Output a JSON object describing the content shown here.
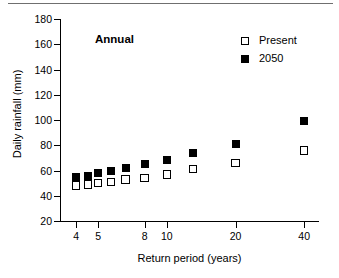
{
  "chart_data": {
    "type": "scatter",
    "title": "",
    "annotation": "Annual",
    "xlabel": "Return period (years)",
    "ylabel": "Daily rainfall (mm)",
    "xscale": "log",
    "xlim": [
      3.4,
      46
    ],
    "ylim": [
      20,
      180
    ],
    "yticks": [
      20,
      40,
      60,
      80,
      100,
      120,
      140,
      160,
      180
    ],
    "xticks": [
      4,
      5,
      8,
      10,
      20,
      40
    ],
    "xtick_labels": [
      "4",
      "5",
      "8",
      "10",
      "20",
      "40"
    ],
    "grid": false,
    "legend_position": "top-right",
    "x": [
      4.0,
      4.5,
      5.0,
      5.7,
      6.6,
      8.0,
      10.0,
      13.0,
      20.0,
      40.0
    ],
    "series": [
      {
        "name": "Present",
        "marker": "open-square",
        "color": "#000000",
        "values": [
          48,
          49,
          50,
          51,
          53,
          54,
          57,
          61,
          66,
          76
        ]
      },
      {
        "name": "2050",
        "marker": "filled-square",
        "color": "#000000",
        "values": [
          55,
          56,
          58,
          60,
          62,
          65,
          68,
          74,
          81,
          99
        ]
      }
    ]
  },
  "legend": {
    "items": [
      {
        "label": "Present",
        "marker": "open-square"
      },
      {
        "label": "2050",
        "marker": "filled-square"
      }
    ]
  }
}
